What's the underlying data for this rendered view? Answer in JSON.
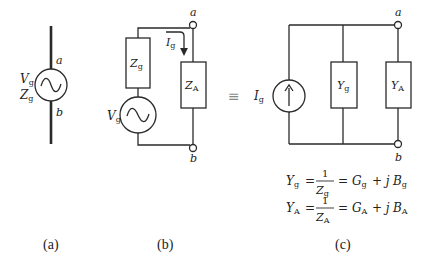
{
  "figure": {
    "panel_a": {
      "caption": "(a)",
      "source_label_v": "V",
      "source_label_v_sub": "g",
      "source_label_z": "Z",
      "source_label_z_sub": "g",
      "terminal_top": "a",
      "terminal_bottom": "b"
    },
    "panel_b": {
      "caption": "(b)",
      "series_impedance": "Z",
      "series_impedance_sub": "g",
      "voltage_source": "V",
      "voltage_source_sub": "g",
      "current": "I",
      "current_sub": "g",
      "load_impedance": "Z",
      "load_impedance_sub": "A",
      "terminal_top": "a",
      "terminal_bottom": "b"
    },
    "equivalence_symbol": "≡",
    "panel_c": {
      "caption": "(c)",
      "current_source": "I",
      "current_source_sub": "g",
      "source_admittance": "Y",
      "source_admittance_sub": "g",
      "load_admittance": "Y",
      "load_admittance_sub": "A",
      "terminal_top": "a",
      "terminal_bottom": "b",
      "equations": [
        {
          "lhs": "Y",
          "lhs_sub": "g",
          "num": "1",
          "den": "Z",
          "den_sub": "g",
          "rhs_g": "G",
          "rhs_g_sub": "g",
          "plus_j": "+ j",
          "rhs_b": "B",
          "rhs_b_sub": "g"
        },
        {
          "lhs": "Y",
          "lhs_sub": "A",
          "num": "1",
          "den": "Z",
          "den_sub": "A",
          "rhs_g": "G",
          "rhs_g_sub": "A",
          "plus_j": "+ j",
          "rhs_b": "B",
          "rhs_b_sub": "A"
        }
      ],
      "equals": "="
    },
    "line_color": "#2a2a2a"
  }
}
